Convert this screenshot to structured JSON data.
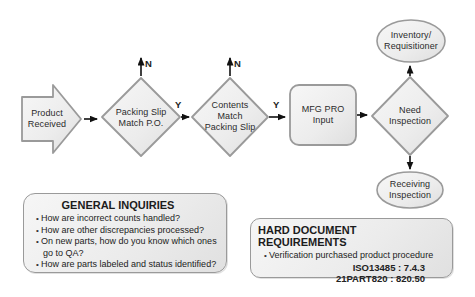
{
  "flowchart": {
    "nodes": {
      "product_received": {
        "lines": [
          "Product",
          "Received"
        ]
      },
      "packing_slip_match_po": {
        "lines": [
          "Packing Slip",
          "Match P.O."
        ]
      },
      "contents_match_packing_slip": {
        "lines": [
          "Contents",
          "Match",
          "Packing Slip"
        ]
      },
      "mfg_pro_input": {
        "lines": [
          "MFG PRO",
          "Input"
        ]
      },
      "need_inspection": {
        "lines": [
          "Need",
          "Inspection"
        ]
      },
      "inventory_requisitioner": {
        "lines": [
          "Inventory/",
          "Requisitioner"
        ]
      },
      "receiving_inspection": {
        "lines": [
          "Receiving",
          "Inspection"
        ]
      }
    },
    "edge_labels": {
      "packing_slip_no": "N",
      "contents_no": "N",
      "packing_slip_yes": "Y",
      "contents_yes": "Y"
    }
  },
  "general_inquiries": {
    "title": "GENERAL INQUIRIES",
    "items": [
      "How are incorrect counts handled?",
      "How are other discrepancies processed?",
      "On new parts, how do you know which ones go to QA?",
      "How are parts labeled and status identified?"
    ]
  },
  "hard_document_requirements": {
    "title": "HARD DOCUMENT REQUIREMENTS",
    "items": [
      "Verification purchased product procedure"
    ],
    "references": [
      "ISO13485 : 7.4.3",
      "21PART820 : 820.50"
    ]
  },
  "colors": {
    "shape_fill_light": "#f6f6f6",
    "shape_fill_dark": "#e0e0e0",
    "shape_border": "#9a9a9a",
    "arrow": "#111111",
    "text": "#2b2b2b",
    "background": "#ffffff"
  }
}
